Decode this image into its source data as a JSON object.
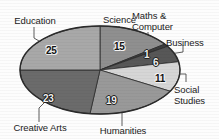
{
  "chart_data": {
    "type": "pie",
    "title": "",
    "subtitle": "",
    "xlabel": "",
    "ylabel": "",
    "legend_position": "none",
    "grid": false,
    "total": 100,
    "units": "percent",
    "categories": [
      "Science",
      "Maths & Computer",
      "Business",
      "Social Studies",
      "Humanities",
      "Creative Arts",
      "Education"
    ],
    "values": [
      15,
      1,
      6,
      11,
      19,
      23,
      25
    ],
    "slices": [
      {
        "label": "Science",
        "label_text": "Science",
        "value": 15,
        "value_text": "15",
        "color": "#8f8f8f",
        "start_angle": 0,
        "end_angle": 54
      },
      {
        "label": "Maths & Computer",
        "label_text": "Maths &\nComputer",
        "value": 1,
        "value_text": "1",
        "color": "#3c3c3c",
        "start_angle": 54,
        "end_angle": 57.6
      },
      {
        "label": "Business",
        "label_text": "Business",
        "value": 6,
        "value_text": "6",
        "color": "#575757",
        "start_angle": 57.6,
        "end_angle": 79.2
      },
      {
        "label": "Social Studies",
        "label_text": "Social\nStudies",
        "value": 11,
        "value_text": "11",
        "color": "#d6d6d6",
        "start_angle": 79.2,
        "end_angle": 118.8
      },
      {
        "label": "Humanities",
        "label_text": "Humanities",
        "value": 19,
        "value_text": "19",
        "color": "#999999",
        "start_angle": 118.8,
        "end_angle": 187.2
      },
      {
        "label": "Creative Arts",
        "label_text": "Creative Arts",
        "value": 23,
        "value_text": "23",
        "color": "#6b6b6b",
        "start_angle": 187.2,
        "end_angle": 270
      },
      {
        "label": "Education",
        "label_text": "Education",
        "value": 25,
        "value_text": "25",
        "color": "#a8a8a8",
        "start_angle": 270,
        "end_angle": 360
      }
    ],
    "outline_color": "#2b2b2b",
    "background_color": "#fdfdfd"
  },
  "labels": {
    "education": "Education",
    "science": "Science",
    "maths_computer": "Maths &\nComputer",
    "business": "Business",
    "social_studies": "Social\nStudies",
    "humanities": "Humanities",
    "creative_arts": "Creative Arts"
  },
  "values": {
    "education": "25",
    "science": "15",
    "maths_computer": "1",
    "business": "6",
    "social_studies": "11",
    "humanities": "19",
    "creative_arts": "23"
  }
}
